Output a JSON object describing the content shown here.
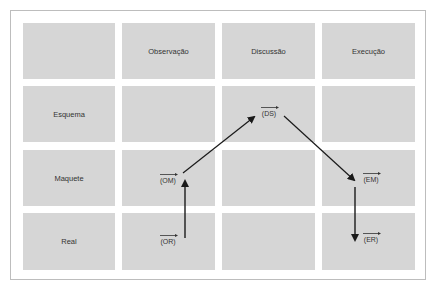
{
  "columns": [
    "",
    "Observação",
    "Discussão",
    "Execução"
  ],
  "rows": [
    "Esquema",
    "Maquete",
    "Real"
  ],
  "nodes": {
    "OM": {
      "label": "(OM)"
    },
    "OR": {
      "label": "(OR)"
    },
    "DS": {
      "label": "(DS)"
    },
    "EM": {
      "label": "(EM)"
    },
    "ER": {
      "label": "(ER)"
    }
  },
  "edges": [
    {
      "from": "OR",
      "to": "OM"
    },
    {
      "from": "OM",
      "to": "DS"
    },
    {
      "from": "DS",
      "to": "EM"
    },
    {
      "from": "EM",
      "to": "ER"
    }
  ],
  "colors": {
    "cell": "#d6d6d6",
    "arrow": "#1a1a1a",
    "border": "#bdbdbd"
  }
}
